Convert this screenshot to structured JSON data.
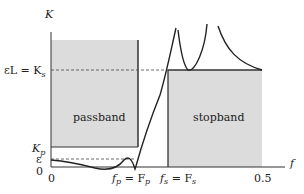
{
  "diagram": {
    "axes": {
      "y_label": "K",
      "x_label": "f",
      "x_ticks": [
        "0",
        "0.5"
      ],
      "y_ticks": [
        "0"
      ]
    },
    "y_levels": {
      "ks_label_main": "εL = K",
      "ks_label_sub": "s",
      "kp_label_main": "K",
      "kp_label_sub": "p",
      "eps_label": "ε",
      "zero_label": "0"
    },
    "x_markers": {
      "fp_main_f": "f",
      "fp_sub": "p",
      "fp_eq": " = F",
      "fp_sub2": "p",
      "fs_main_f": "f",
      "fs_sub": "s",
      "fs_eq": " = F",
      "fs_sub2": "s",
      "x_zero": "0",
      "x_half": "0.5"
    },
    "regions": {
      "passband": "passband",
      "stopband": "stopband"
    },
    "colors": {
      "band_fill": "#dcdcdc",
      "line": "#222222",
      "background": "#ffffff"
    }
  }
}
